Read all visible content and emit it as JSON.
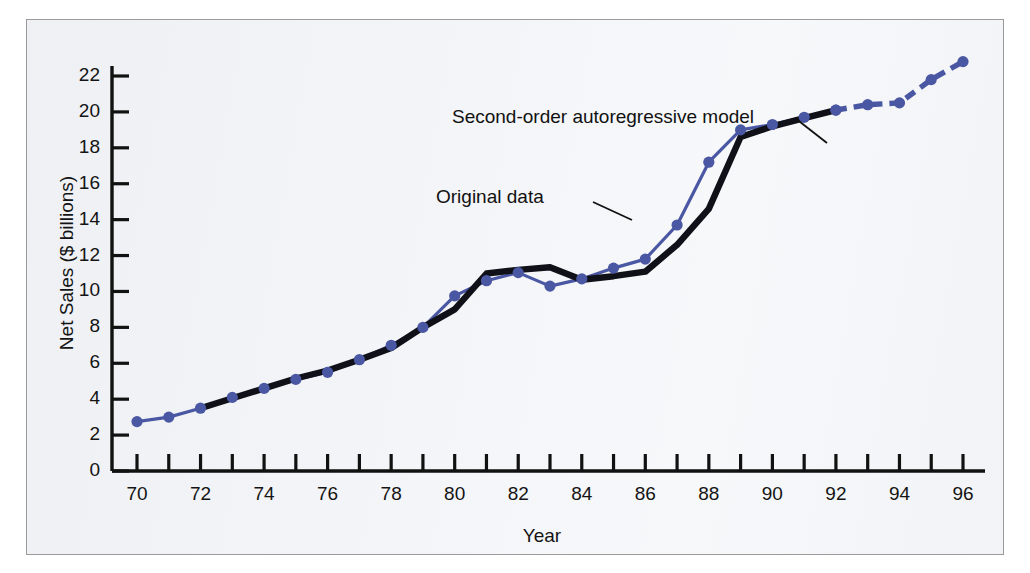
{
  "figure": {
    "background_color": "#f3f4f7",
    "border_color": "#9a9a9a"
  },
  "axes": {
    "y_title": "Net Sales ($ billions)",
    "x_title": "Year",
    "y_tick_labels": [
      "0",
      "2",
      "4",
      "6",
      "8",
      "10",
      "12",
      "14",
      "16",
      "18",
      "20",
      "22"
    ],
    "x_tick_labels": [
      "70",
      "72",
      "74",
      "76",
      "78",
      "80",
      "82",
      "84",
      "86",
      "88",
      "90",
      "92",
      "94",
      "96"
    ]
  },
  "annotations": {
    "model_label": "Second-order autoregressive model",
    "original_label": "Original data"
  },
  "chart_data": {
    "type": "line",
    "title": "",
    "subtitle": "",
    "xlabel": "Year",
    "ylabel": "Net Sales ($ billions)",
    "xlim": [
      69.2,
      96.8
    ],
    "ylim": [
      0,
      23.2
    ],
    "x_ticks": [
      70,
      71,
      72,
      73,
      74,
      75,
      76,
      77,
      78,
      79,
      80,
      81,
      82,
      83,
      84,
      85,
      86,
      87,
      88,
      89,
      90,
      91,
      92,
      93,
      94,
      95,
      96
    ],
    "x_tick_labels_shown": [
      70,
      72,
      74,
      76,
      78,
      80,
      82,
      84,
      86,
      88,
      90,
      92,
      94,
      96
    ],
    "y_ticks": [
      0,
      2,
      4,
      6,
      8,
      10,
      12,
      14,
      16,
      18,
      20,
      22
    ],
    "grid": false,
    "legend": "annotations",
    "colors": {
      "original": "#4a57a3",
      "model": "#101018"
    },
    "series": [
      {
        "name": "Original data",
        "color": "#4a57a3",
        "style": "solid-with-markers",
        "x": [
          70,
          71,
          72,
          73,
          74,
          75,
          76,
          77,
          78,
          79,
          80,
          81,
          82,
          83,
          84,
          85,
          86,
          87,
          88,
          89,
          90,
          91,
          92
        ],
        "values": [
          2.75,
          3.0,
          3.5,
          4.1,
          4.6,
          5.1,
          5.5,
          6.2,
          7.0,
          8.0,
          9.75,
          10.6,
          11.05,
          10.3,
          10.7,
          11.3,
          11.8,
          13.7,
          17.2,
          19.0,
          19.3,
          19.7,
          20.1
        ]
      },
      {
        "name": "Original data forecast",
        "color": "#4a57a3",
        "style": "dashed-with-markers",
        "x": [
          92,
          93,
          94,
          95,
          96
        ],
        "values": [
          20.1,
          20.4,
          20.5,
          21.8,
          22.8
        ]
      },
      {
        "name": "Second-order autoregressive model",
        "color": "#101018",
        "style": "thick-solid",
        "x": [
          72,
          73,
          74,
          75,
          76,
          77,
          78,
          79,
          80,
          81,
          82,
          83,
          84,
          85,
          86,
          87,
          88,
          89,
          90,
          91,
          92
        ],
        "values": [
          3.5,
          4.05,
          4.6,
          5.15,
          5.6,
          6.2,
          6.85,
          8.0,
          9.0,
          11.0,
          11.2,
          11.35,
          10.65,
          10.85,
          11.1,
          12.6,
          14.6,
          18.6,
          19.2,
          19.65,
          20.1
        ]
      }
    ]
  }
}
